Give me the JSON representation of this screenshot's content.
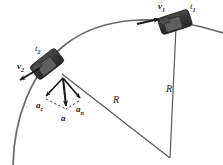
{
  "figure": {
    "background_color": "#ffffff",
    "arc_color": "#6b6b6b",
    "radius_line_color": "#5a5a5a",
    "vector_color": "#1a1a1a",
    "car_body_color": "#3a3a3a",
    "car_detail_color": "#6e6e6e"
  },
  "labels": {
    "v1": {
      "base": "v",
      "sub": "1"
    },
    "t1": {
      "base": "t",
      "sub": "1"
    },
    "v2": {
      "base": "v",
      "sub": "2"
    },
    "t2": {
      "base": "t",
      "sub": "2"
    },
    "a_c": {
      "base": "a",
      "sub": "c"
    },
    "a_n": {
      "base": "a",
      "sub": "n"
    },
    "a": {
      "base": "a",
      "sub": ""
    },
    "radius_left": {
      "base": "R",
      "sub": ""
    },
    "radius_right": {
      "base": "R",
      "sub": ""
    }
  },
  "geometry": {
    "center": {
      "x": 170,
      "y": 158
    },
    "arc_radius": 143,
    "car1": {
      "x": 175,
      "y": 22,
      "angle_deg": -18
    },
    "car2": {
      "x": 47,
      "y": 64,
      "angle_deg": -38
    },
    "vector_origin": {
      "x": 63,
      "y": 78
    }
  }
}
